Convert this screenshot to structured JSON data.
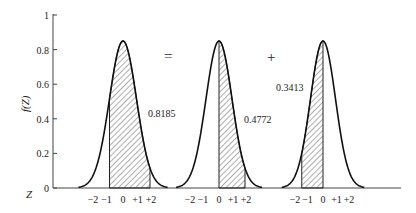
{
  "figure": {
    "ylabel": "f(Z)",
    "xlabel": "Z",
    "y_ticks": [
      "0",
      "0.2",
      "0.4",
      "0.6",
      "0.8",
      "1"
    ],
    "operators": {
      "equals": "=",
      "plus": "+"
    },
    "panels": [
      {
        "center": 123,
        "sigma": 13.5,
        "shade_from": -1,
        "shade_to": 2,
        "area_label": "0.8185",
        "label_x": 148,
        "label_y": 117,
        "tick_labels": [
          "−2",
          "−1",
          "0",
          "+1",
          "+2"
        ]
      },
      {
        "center": 219,
        "sigma": 13.0,
        "shade_from": 0,
        "shade_to": 2,
        "area_label": "0.4772",
        "label_x": 244,
        "label_y": 123,
        "tick_labels": [
          "−2",
          "−1",
          "0",
          "+1",
          "+2"
        ]
      },
      {
        "center": 323,
        "sigma": 12.5,
        "shade_from": -1.7,
        "shade_to": 0,
        "area_label": "0.3413",
        "label_x": 276,
        "label_y": 91,
        "tick_labels": [
          "−2",
          "−1",
          "0",
          "+1",
          "+2"
        ]
      }
    ]
  },
  "chart_data": {
    "type": "area",
    "title": "",
    "xlabel": "Z",
    "ylabel": "f(Z)",
    "ylim": [
      0,
      1
    ],
    "y_ticks": [
      0,
      0.2,
      0.4,
      0.6,
      0.8,
      1
    ],
    "x_ticks": [
      -2,
      -1,
      0,
      1,
      2
    ],
    "series": [
      {
        "name": "P(-1 < Z < 2)",
        "shaded_interval": [
          -1,
          2
        ],
        "area": 0.8185
      },
      {
        "name": "P(0 < Z < 2)",
        "shaded_interval": [
          0,
          2
        ],
        "area": 0.4772
      },
      {
        "name": "P(-1 < Z < 0)",
        "shaded_interval": [
          -1,
          0
        ],
        "area": 0.3413
      }
    ],
    "annotations": [
      "=",
      "+"
    ],
    "grid": false
  }
}
